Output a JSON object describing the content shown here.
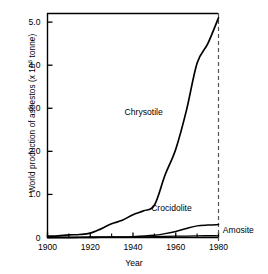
{
  "chart_data": {
    "type": "line",
    "title": "",
    "xlabel": "Year",
    "ylabel": "World production of asbestos (x 10⁶ tonne)",
    "ylabel_main": "World production of asbestos (x 10",
    "ylabel_sup": "6",
    "ylabel_tail": " tonne)",
    "xlim": [
      1900,
      1980
    ],
    "ylim": [
      0,
      5.2
    ],
    "grid": false,
    "legend_position": "inline-annotations",
    "y_ticks": [
      "0",
      "1.0",
      "2.0",
      "3.0",
      "4.0",
      "5.0"
    ],
    "y_tick_values": [
      0,
      1.0,
      2.0,
      3.0,
      4.0,
      5.0
    ],
    "x_ticks": [
      "1900",
      "1920",
      "1940",
      "1960",
      "1980"
    ],
    "x_tick_values": [
      1900,
      1920,
      1940,
      1960,
      1980
    ],
    "x_minor_ticks": [
      1910,
      1930,
      1950,
      1970
    ],
    "annotations": [
      {
        "name": "chrysotile-label",
        "text": "Chrysotile",
        "x": 1945,
        "y": 2.85
      },
      {
        "name": "crocidolite-label",
        "text": "Crocidolite",
        "x": 1958,
        "y": 0.62
      },
      {
        "name": "amosite-label",
        "text": "Amosite",
        "x": 1982,
        "y": 0.1
      }
    ],
    "reference_line": {
      "name": "year-1980-marker",
      "x": 1980,
      "style": "dashed"
    },
    "series": [
      {
        "name": "Chrysotile",
        "x": [
          1900,
          1905,
          1910,
          1915,
          1920,
          1925,
          1930,
          1935,
          1940,
          1945,
          1950,
          1955,
          1960,
          1965,
          1970,
          1975,
          1980
        ],
        "values": [
          0.03,
          0.04,
          0.06,
          0.07,
          0.1,
          0.2,
          0.32,
          0.4,
          0.53,
          0.62,
          0.75,
          1.45,
          2.05,
          2.95,
          4.05,
          4.5,
          5.1
        ]
      },
      {
        "name": "Crocidolite",
        "x": [
          1900,
          1910,
          1920,
          1930,
          1940,
          1950,
          1955,
          1960,
          1965,
          1970,
          1975,
          1980
        ],
        "values": [
          0.0,
          0.0,
          0.01,
          0.01,
          0.02,
          0.05,
          0.09,
          0.14,
          0.21,
          0.27,
          0.29,
          0.3
        ]
      },
      {
        "name": "Amosite",
        "x": [
          1900,
          1910,
          1920,
          1930,
          1940,
          1950,
          1960,
          1970,
          1980
        ],
        "values": [
          0.0,
          0.0,
          0.0,
          0.01,
          0.01,
          0.02,
          0.03,
          0.04,
          0.04
        ]
      }
    ]
  }
}
